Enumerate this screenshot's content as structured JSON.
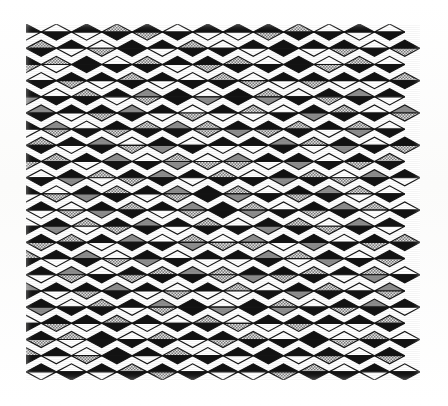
{
  "page": {
    "background_color": "#fdfdfc",
    "width": 448,
    "height": 406
  },
  "artwork": {
    "name": "diamond-lattice-pattern",
    "description": "Halftone print of a rhombic lattice; each diamond is split into an upper and a lower triangle filled with black, white, solid gray or dotted gray. Composition is mirror-symmetric about the vertical and horizontal centre axes producing X-shaped diagonal bands.",
    "bounds": {
      "x": 26,
      "y": 24,
      "width": 394,
      "height": 356
    },
    "grid": {
      "columns": 13,
      "rows": 22,
      "cell_width": 30.3,
      "cell_height": 16.18
    },
    "outline_color": "#141414",
    "outline_width": 1.15,
    "palette": {
      "black": "#121212",
      "white": "#ffffff",
      "gray": "#8d8d8d",
      "dotted": "#cfcfcf",
      "dotted_dot": "#6e6e6e",
      "background": "#ffffff"
    },
    "tone_legend": [
      {
        "key": "k",
        "label": "black",
        "color": "#121212"
      },
      {
        "key": "w",
        "label": "white",
        "color": "#ffffff"
      },
      {
        "key": "g",
        "label": "solid gray",
        "color": "#8d8d8d"
      },
      {
        "key": "d",
        "label": "dotted gray",
        "color": "#cfcfcf"
      }
    ],
    "tiles": [
      [
        "kw",
        "wk",
        "kw",
        "dk",
        "kd",
        "wk",
        "kw",
        "kw",
        "kd",
        "dk",
        "wk",
        "kw",
        "wk"
      ],
      [
        "dk",
        "kw",
        "wd",
        "kk",
        "kw",
        "dk",
        "wk",
        "kw",
        "kk",
        "kw",
        "kd",
        "wk",
        "kd"
      ],
      [
        "kd",
        "dw",
        "kk",
        "wk",
        "dk",
        "kw",
        "kd",
        "dk",
        "wk",
        "kk",
        "wd",
        "dk",
        "wk"
      ],
      [
        "wk",
        "kd",
        "kw",
        "dk",
        "kw",
        "wk",
        "dk",
        "wd",
        "kw",
        "kd",
        "kw",
        "kw",
        "dk"
      ],
      [
        "kg",
        "wk",
        "dk",
        "kw",
        "gd",
        "kk",
        "wg",
        "kk",
        "dg",
        "wk",
        "kd",
        "gk",
        "kw"
      ],
      [
        "gk",
        "kw",
        "kd",
        "gk",
        "kw",
        "wd",
        "kw",
        "dw",
        "wk",
        "kg",
        "dk",
        "wk",
        "gd"
      ],
      [
        "kw",
        "gd",
        "wk",
        "kd",
        "dk",
        "gk",
        "dd",
        "kg",
        "kd",
        "dk",
        "kw",
        "dg",
        "wk"
      ],
      [
        "dk",
        "kw",
        "gk",
        "wd",
        "kg",
        "wk",
        "kw",
        "kw",
        "gk",
        "dw",
        "kg",
        "wk",
        "kd"
      ],
      [
        "kd",
        "dk",
        "kw",
        "gk",
        "wk",
        "dg",
        "wd",
        "gd",
        "kw",
        "kg",
        "wk",
        "kd",
        "dk"
      ],
      [
        "wk",
        "kg",
        "dw",
        "kd",
        "gk",
        "kw",
        "dk",
        "wk",
        "kg",
        "dk",
        "wd",
        "gk",
        "kw"
      ],
      [
        "kw",
        "wd",
        "kg",
        "dk",
        "kw",
        "gd",
        "kk",
        "dg",
        "wk",
        "kd",
        "gk",
        "dw",
        "wk"
      ],
      [
        "kw",
        "wd",
        "kg",
        "dk",
        "kw",
        "gd",
        "kk",
        "dg",
        "wk",
        "kd",
        "gk",
        "dw",
        "wk"
      ],
      [
        "wk",
        "kg",
        "dw",
        "kd",
        "gk",
        "kw",
        "dk",
        "wk",
        "kg",
        "dk",
        "wd",
        "gk",
        "kw"
      ],
      [
        "kd",
        "dk",
        "kw",
        "gk",
        "wk",
        "dg",
        "wd",
        "gd",
        "kw",
        "kg",
        "wk",
        "kd",
        "dk"
      ],
      [
        "dk",
        "kw",
        "gk",
        "wd",
        "kg",
        "wk",
        "kw",
        "kw",
        "gk",
        "dw",
        "kg",
        "wk",
        "kd"
      ],
      [
        "kw",
        "gd",
        "wk",
        "kd",
        "dk",
        "gk",
        "dd",
        "kg",
        "kd",
        "dk",
        "kw",
        "dg",
        "wk"
      ],
      [
        "gk",
        "kw",
        "kd",
        "gk",
        "kw",
        "wd",
        "kw",
        "dw",
        "wk",
        "kg",
        "dk",
        "wk",
        "gd"
      ],
      [
        "kg",
        "wk",
        "dk",
        "kw",
        "gd",
        "kk",
        "wg",
        "kk",
        "dg",
        "wk",
        "kd",
        "gk",
        "kw"
      ],
      [
        "wk",
        "kd",
        "kw",
        "dk",
        "kw",
        "wk",
        "dk",
        "wd",
        "kw",
        "kd",
        "kw",
        "kw",
        "dk"
      ],
      [
        "kd",
        "dw",
        "kk",
        "wk",
        "dk",
        "kw",
        "kd",
        "dk",
        "wk",
        "kk",
        "wd",
        "dk",
        "wk"
      ],
      [
        "dk",
        "kw",
        "wd",
        "kk",
        "kw",
        "dk",
        "wk",
        "kw",
        "kk",
        "kw",
        "kd",
        "wk",
        "kd"
      ],
      [
        "kw",
        "wk",
        "kw",
        "dk",
        "kd",
        "wk",
        "kw",
        "kw",
        "kd",
        "dk",
        "wk",
        "kw",
        "wk"
      ]
    ]
  }
}
